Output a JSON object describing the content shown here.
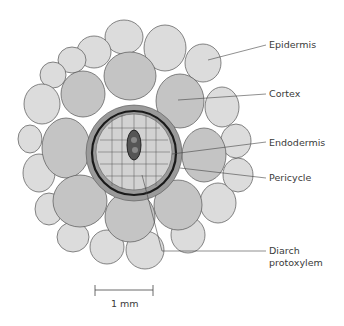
{
  "diagram": {
    "type": "root cross-section",
    "labels": {
      "epidermis": "Epidermis",
      "cortex": "Cortex",
      "endodermis": "Endodermis",
      "pericycle": "Pericycle",
      "protoxylem_line1": "Diarch",
      "protoxylem_line2": "protoxylem"
    },
    "scale_bar": {
      "label": "1 mm"
    },
    "colors": {
      "epidermis": "#dcdcdc",
      "cortex": "#c4c4c4",
      "pericycle": "#9a9a9a",
      "endodermis_ring": "#1a1a1a",
      "stele": "#d2d2d2",
      "xylem": "#555555"
    }
  }
}
